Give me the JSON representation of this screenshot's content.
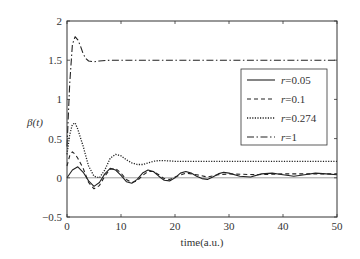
{
  "chart_data": {
    "type": "line",
    "title": "",
    "xlabel": "time(a.u.)",
    "ylabel": "β(t)",
    "xlim": [
      0,
      50
    ],
    "ylim": [
      -0.5,
      2
    ],
    "xticks": [
      0,
      10,
      20,
      30,
      40,
      50
    ],
    "xtick_labels": [
      "0",
      "10",
      "20",
      "30",
      "40",
      "50"
    ],
    "yticks": [
      -0.5,
      0,
      0.5,
      1,
      1.5,
      2
    ],
    "ytick_labels": [
      "−0.5",
      "0",
      "0.5",
      "1",
      "1.5",
      "2"
    ],
    "grid": false,
    "legend_position": "upper right (inset)",
    "reference_line": {
      "y": 0,
      "style": "thin solid gray"
    },
    "values_are_approximate": true,
    "series": [
      {
        "name": "r=0.05",
        "style": "solid",
        "description": "damped oscillation about ~0.05, first peak ~0.14 near t≈2, period ~7",
        "points": [
          [
            0,
            0
          ],
          [
            1,
            0.1
          ],
          [
            2,
            0.14
          ],
          [
            3,
            0.07
          ],
          [
            4,
            -0.04
          ],
          [
            5,
            -0.11
          ],
          [
            6,
            -0.06
          ],
          [
            7,
            0.05
          ],
          [
            8,
            0.12
          ],
          [
            9,
            0.1
          ],
          [
            10,
            0.03
          ],
          [
            11,
            -0.05
          ],
          [
            12,
            -0.07
          ],
          [
            13,
            -0.02
          ],
          [
            14,
            0.06
          ],
          [
            15,
            0.1
          ],
          [
            16,
            0.08
          ],
          [
            17,
            0.02
          ],
          [
            18,
            -0.03
          ],
          [
            19,
            -0.04
          ],
          [
            20,
            0
          ],
          [
            21,
            0.06
          ],
          [
            22,
            0.08
          ],
          [
            23,
            0.06
          ],
          [
            24,
            0.02
          ],
          [
            25,
            -0.01
          ],
          [
            26,
            -0.02
          ],
          [
            27,
            0.01
          ],
          [
            28,
            0.05
          ],
          [
            29,
            0.07
          ],
          [
            30,
            0.06
          ],
          [
            32,
            0.02
          ],
          [
            34,
            0.01
          ],
          [
            36,
            0.05
          ],
          [
            38,
            0.06
          ],
          [
            40,
            0.04
          ],
          [
            42,
            0.02
          ],
          [
            44,
            0.04
          ],
          [
            46,
            0.06
          ],
          [
            48,
            0.05
          ],
          [
            50,
            0.04
          ]
        ]
      },
      {
        "name": "r=0.1",
        "style": "dashed",
        "description": "first peak ~0.33 near t≈1.5, then damped oscillation near ~0.05 phase-shifted from the solid curve",
        "points": [
          [
            0,
            0.15
          ],
          [
            0.5,
            0.28
          ],
          [
            1,
            0.33
          ],
          [
            1.5,
            0.3
          ],
          [
            2,
            0.25
          ],
          [
            3,
            0.12
          ],
          [
            4,
            -0.06
          ],
          [
            5,
            -0.14
          ],
          [
            6,
            -0.1
          ],
          [
            7,
            0.02
          ],
          [
            8,
            0.11
          ],
          [
            9,
            0.12
          ],
          [
            10,
            0.06
          ],
          [
            11,
            -0.02
          ],
          [
            12,
            -0.06
          ],
          [
            13,
            -0.04
          ],
          [
            14,
            0.03
          ],
          [
            15,
            0.08
          ],
          [
            16,
            0.08
          ],
          [
            17,
            0.04
          ],
          [
            18,
            -0.01
          ],
          [
            19,
            -0.02
          ],
          [
            20,
            0.01
          ],
          [
            22,
            0.06
          ],
          [
            24,
            0.04
          ],
          [
            26,
            0.01
          ],
          [
            28,
            0.04
          ],
          [
            30,
            0.05
          ],
          [
            35,
            0.04
          ],
          [
            40,
            0.05
          ],
          [
            45,
            0.05
          ],
          [
            50,
            0.05
          ]
        ]
      },
      {
        "name": "r=0.274",
        "style": "dotted",
        "description": "sharp peak ~0.70 near t≈1.5, dips near 0, secondary peak ~0.30, settles ~0.21",
        "points": [
          [
            0,
            0.3
          ],
          [
            0.5,
            0.55
          ],
          [
            1,
            0.68
          ],
          [
            1.5,
            0.7
          ],
          [
            2,
            0.62
          ],
          [
            3,
            0.4
          ],
          [
            4,
            0.15
          ],
          [
            5,
            0.02
          ],
          [
            6,
            0.0
          ],
          [
            7,
            0.1
          ],
          [
            8,
            0.25
          ],
          [
            9,
            0.3
          ],
          [
            10,
            0.28
          ],
          [
            11,
            0.23
          ],
          [
            12,
            0.19
          ],
          [
            13,
            0.17
          ],
          [
            14,
            0.17
          ],
          [
            15,
            0.19
          ],
          [
            16,
            0.21
          ],
          [
            17,
            0.22
          ],
          [
            18,
            0.22
          ],
          [
            20,
            0.21
          ],
          [
            25,
            0.21
          ],
          [
            30,
            0.21
          ],
          [
            35,
            0.21
          ],
          [
            40,
            0.21
          ],
          [
            45,
            0.21
          ],
          [
            50,
            0.21
          ]
        ]
      },
      {
        "name": "r=1",
        "style": "dash-dot",
        "description": "rises from ~0.4 to peak ~1.8 at t≈1.5, settles at ~1.5 by t≈5",
        "points": [
          [
            0,
            0.4
          ],
          [
            0.5,
            1.2
          ],
          [
            1,
            1.7
          ],
          [
            1.5,
            1.8
          ],
          [
            2,
            1.76
          ],
          [
            2.5,
            1.68
          ],
          [
            3,
            1.58
          ],
          [
            3.5,
            1.52
          ],
          [
            4,
            1.49
          ],
          [
            5,
            1.48
          ],
          [
            6,
            1.49
          ],
          [
            8,
            1.5
          ],
          [
            10,
            1.5
          ],
          [
            15,
            1.5
          ],
          [
            20,
            1.5
          ],
          [
            30,
            1.5
          ],
          [
            40,
            1.5
          ],
          [
            50,
            1.5
          ]
        ]
      }
    ]
  },
  "legend": {
    "items": [
      {
        "label": "r=0.05",
        "style": "solid"
      },
      {
        "label": "r=0.1",
        "style": "dashed"
      },
      {
        "label": "r=0.274",
        "style": "dotted"
      },
      {
        "label": "r=1",
        "style": "dash-dot"
      }
    ]
  },
  "colors": {
    "line": "#222222",
    "axis": "#333333",
    "zero_line": "#888888",
    "background": "#ffffff"
  }
}
